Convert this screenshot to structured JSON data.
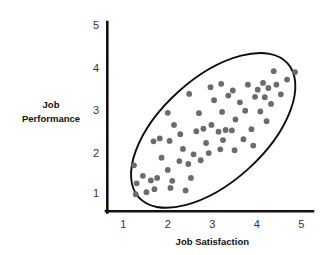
{
  "chart_data": {
    "type": "scatter",
    "title": "",
    "xlabel": "Job Satisfaction",
    "ylabel": "Job Performance",
    "xlim": [
      0.5,
      5.2
    ],
    "ylim": [
      0.45,
      5.2
    ],
    "xticks": [
      1,
      2,
      3,
      4,
      5
    ],
    "yticks": [
      1,
      2,
      3,
      4,
      5
    ],
    "xtick_labels": [
      "1",
      "2",
      "3",
      "4",
      "5"
    ],
    "ytick_labels": [
      "1",
      "2",
      "3",
      "4",
      "5"
    ],
    "grid": false,
    "legend": null,
    "relationship": "positive linear correlation",
    "point_color": "#6b6b6b",
    "point_radius": 2.9,
    "outline_color": "#0d0d0d",
    "axis_color": "#111111",
    "background": "#ffffff",
    "annotations": [
      {
        "kind": "ellipse",
        "label": "correlation-envelope",
        "cx": 3.02,
        "cy": 2.49,
        "rx": 2.25,
        "ry": 1.24,
        "rotation_deg": -42
      }
    ],
    "points": [
      {
        "x": 1.28,
        "y": 0.97
      },
      {
        "x": 1.3,
        "y": 1.23
      },
      {
        "x": 1.24,
        "y": 1.66
      },
      {
        "x": 1.44,
        "y": 1.41
      },
      {
        "x": 1.52,
        "y": 1.02
      },
      {
        "x": 1.62,
        "y": 1.3
      },
      {
        "x": 1.7,
        "y": 1.09
      },
      {
        "x": 1.76,
        "y": 1.36
      },
      {
        "x": 1.86,
        "y": 1.84
      },
      {
        "x": 1.82,
        "y": 2.3
      },
      {
        "x": 1.68,
        "y": 2.23
      },
      {
        "x": 2.0,
        "y": 1.55
      },
      {
        "x": 2.06,
        "y": 1.12
      },
      {
        "x": 2.1,
        "y": 1.29
      },
      {
        "x": 2.04,
        "y": 2.24
      },
      {
        "x": 2.14,
        "y": 2.62
      },
      {
        "x": 2.0,
        "y": 2.91
      },
      {
        "x": 2.28,
        "y": 2.4
      },
      {
        "x": 2.34,
        "y": 2.05
      },
      {
        "x": 2.26,
        "y": 1.76
      },
      {
        "x": 2.4,
        "y": 1.06
      },
      {
        "x": 2.52,
        "y": 1.36
      },
      {
        "x": 2.46,
        "y": 1.69
      },
      {
        "x": 2.58,
        "y": 1.92
      },
      {
        "x": 2.64,
        "y": 2.47
      },
      {
        "x": 2.48,
        "y": 3.36
      },
      {
        "x": 2.7,
        "y": 2.9
      },
      {
        "x": 2.8,
        "y": 2.53
      },
      {
        "x": 2.86,
        "y": 2.19
      },
      {
        "x": 2.74,
        "y": 1.78
      },
      {
        "x": 2.92,
        "y": 1.95
      },
      {
        "x": 2.98,
        "y": 2.62
      },
      {
        "x": 3.04,
        "y": 3.21
      },
      {
        "x": 2.96,
        "y": 3.52
      },
      {
        "x": 3.14,
        "y": 2.46
      },
      {
        "x": 3.18,
        "y": 2.04
      },
      {
        "x": 3.24,
        "y": 2.26
      },
      {
        "x": 3.3,
        "y": 2.5
      },
      {
        "x": 3.22,
        "y": 2.93
      },
      {
        "x": 3.36,
        "y": 3.32
      },
      {
        "x": 3.2,
        "y": 3.6
      },
      {
        "x": 3.44,
        "y": 2.49
      },
      {
        "x": 3.5,
        "y": 2.02
      },
      {
        "x": 3.52,
        "y": 2.75
      },
      {
        "x": 3.46,
        "y": 3.44
      },
      {
        "x": 3.62,
        "y": 3.16
      },
      {
        "x": 3.7,
        "y": 2.28
      },
      {
        "x": 3.74,
        "y": 2.96
      },
      {
        "x": 3.8,
        "y": 3.58
      },
      {
        "x": 3.88,
        "y": 2.52
      },
      {
        "x": 3.92,
        "y": 2.13
      },
      {
        "x": 3.96,
        "y": 3.29
      },
      {
        "x": 4.02,
        "y": 3.46
      },
      {
        "x": 4.08,
        "y": 2.94
      },
      {
        "x": 4.14,
        "y": 3.62
      },
      {
        "x": 4.18,
        "y": 3.28
      },
      {
        "x": 4.22,
        "y": 2.71
      },
      {
        "x": 4.26,
        "y": 3.5
      },
      {
        "x": 4.32,
        "y": 3.12
      },
      {
        "x": 4.38,
        "y": 3.9
      },
      {
        "x": 4.44,
        "y": 3.58
      },
      {
        "x": 4.54,
        "y": 3.35
      },
      {
        "x": 4.68,
        "y": 3.7
      },
      {
        "x": 4.86,
        "y": 3.88
      }
    ]
  },
  "figure": {
    "x_axis_title": "Job Satisfaction",
    "y_axis_title_line1": "Job",
    "y_axis_title_line2": "Performance"
  }
}
